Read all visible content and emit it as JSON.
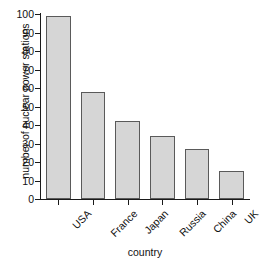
{
  "chart_data": {
    "type": "bar",
    "title": "",
    "xlabel": "country",
    "ylabel": "number of nuclear power stations",
    "categories": [
      "USA",
      "France",
      "Japan",
      "Russia",
      "China",
      "UK"
    ],
    "values": [
      99,
      58,
      42,
      34,
      27,
      15
    ],
    "ylim": [
      0,
      100
    ],
    "yticks": [
      0,
      10,
      20,
      30,
      40,
      50,
      60,
      70,
      80,
      90,
      100
    ],
    "ytick_labels": [
      "0",
      "10",
      "20",
      "30",
      "40",
      "50",
      "60",
      "70",
      "80",
      "90",
      "100"
    ],
    "grid": false,
    "legend": null,
    "bar_fill_color": "#d6d6d6",
    "bar_edge_color": "#5a5a5a",
    "axis_color": "#1a1a1a",
    "background_color": "#ffffff"
  }
}
